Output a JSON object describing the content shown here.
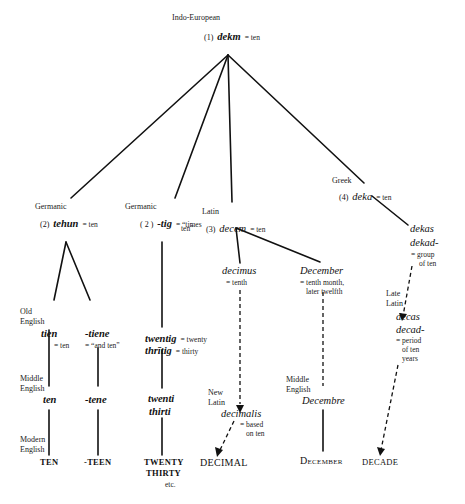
{
  "diagram": {
    "root": {
      "language": "Indo-European",
      "number": "(1)",
      "word": "dekm",
      "gloss": "= ten"
    },
    "branches": {
      "germanic1": {
        "language": "Germanic",
        "number": "(2)",
        "word": "tehun",
        "gloss": "= ten"
      },
      "germanic2": {
        "language": "Germanic",
        "number": "( 2 )",
        "word": "-tig",
        "gloss_line1": "= “times",
        "gloss_line2": "ten”"
      },
      "latin": {
        "language": "Latin",
        "number": "(3)",
        "word": "decem",
        "gloss": "= ten"
      },
      "greek": {
        "language": "Greek",
        "number": "(4)",
        "word": "deka",
        "gloss": "= ten"
      }
    },
    "stage_labels": {
      "old_english_1": "Old",
      "old_english_2": "English",
      "middle_english_1": "Middle",
      "middle_english_2": "English",
      "modern_english_1": "Modern",
      "modern_english_2": "English",
      "middle_english_right_1": "Middle",
      "middle_english_right_2": "English",
      "new_latin_1": "New",
      "new_latin_2": "Latin",
      "late_latin_1": "Late",
      "late_latin_2": "Latin"
    },
    "nodes": {
      "tien": {
        "word": "tien",
        "gloss": "= ten"
      },
      "tiene": {
        "word": "-tiene",
        "gloss": "= “and ten”"
      },
      "twentig": {
        "word": "twentig",
        "gloss": "= twenty"
      },
      "thritig": {
        "word": "thrītig",
        "gloss": "= thirty"
      },
      "ten_me": {
        "word": "ten"
      },
      "tene_me": {
        "word": "-tene"
      },
      "twenti": {
        "word": "twenti"
      },
      "thirti": {
        "word": "thirti"
      },
      "decimus": {
        "word": "decimus",
        "gloss": "= tenth"
      },
      "december_latin": {
        "word": "December",
        "gloss_line1": "= tenth month,",
        "gloss_line2": "later twelfth"
      },
      "decimalis": {
        "word": "decimalis",
        "gloss_line1": "= based",
        "gloss_line2": "on ten"
      },
      "decembre": {
        "word": "Decembre"
      },
      "dekas": {
        "word": "dekas"
      },
      "dekad": {
        "word": "dekad-",
        "gloss_line1": "= group",
        "gloss_line2": "of ten"
      },
      "decas": {
        "word": "decas"
      },
      "decad": {
        "word": "decad-",
        "gloss_line1": "= period",
        "gloss_line2": "of ten",
        "gloss_line3": "years"
      }
    },
    "modern": {
      "ten": "TEN",
      "teen": "-TEEN",
      "twenty": "TWENTY",
      "thirty": "THIRTY",
      "etc": "etc.",
      "decimal": "DECIMAL",
      "december": "December",
      "decade": "DECADE"
    }
  }
}
